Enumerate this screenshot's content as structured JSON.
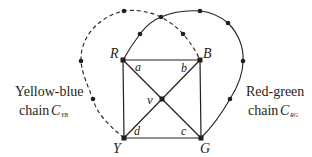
{
  "diagram": {
    "vertices": {
      "R": {
        "label": "R",
        "x": 123,
        "y": 60
      },
      "B": {
        "label": "B",
        "x": 200,
        "y": 60
      },
      "Y": {
        "label": "Y",
        "x": 124,
        "y": 138
      },
      "G": {
        "label": "G",
        "x": 201,
        "y": 138
      },
      "v": {
        "label": "v",
        "x": 162,
        "y": 99
      }
    },
    "angle_labels": {
      "a": "a",
      "b": "b",
      "c": "c",
      "d": "d"
    },
    "chains": {
      "yellow_blue": {
        "text": "Yellow-blue",
        "chain_word": "chain",
        "symbol": "C",
        "subscript": "YB",
        "style": "dashed",
        "from": "Y",
        "to": "B"
      },
      "red_green": {
        "text": "Red-green",
        "chain_word": "chain",
        "symbol": "C",
        "subscript": "RG",
        "style": "solid",
        "from": "R",
        "to": "G"
      }
    },
    "colors": {
      "stroke": "#231f20",
      "background": "#ffffff"
    }
  }
}
